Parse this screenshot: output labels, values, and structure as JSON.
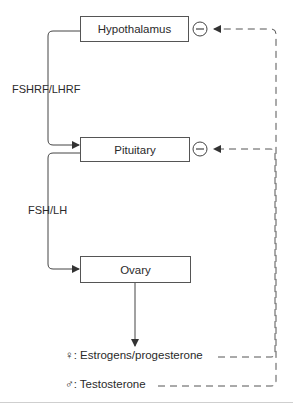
{
  "nodes": {
    "hypothalamus": "Hypothalamus",
    "pituitary": "Pituitary",
    "ovary": "Ovary"
  },
  "edges": {
    "hypothalamus_to_pituitary": "FSHRF/LHRF",
    "pituitary_to_ovary": "FSH/LH"
  },
  "outputs": {
    "female": {
      "symbol": "♀",
      "text": ": Estrogens/progesterone"
    },
    "male": {
      "symbol": "♂",
      "text": ": Testosterone"
    }
  },
  "feedback": {
    "inhibit_symbol": "−",
    "type": "negative feedback"
  },
  "colors": {
    "line": "#444444",
    "box_border": "#555555",
    "text": "#2a2a2a"
  }
}
